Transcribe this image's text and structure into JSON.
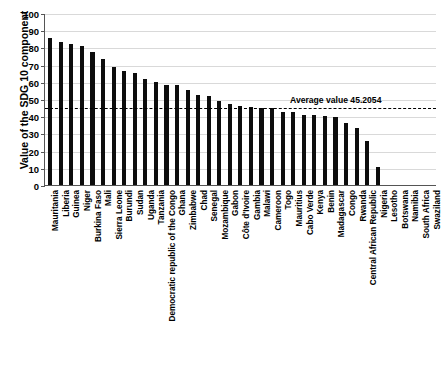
{
  "chart_data": {
    "type": "bar",
    "title": "",
    "xlabel": "",
    "ylabel": "Value of the SDG 10 component",
    "ylim": [
      0,
      100
    ],
    "yticks": [
      0,
      10,
      20,
      30,
      40,
      50,
      60,
      70,
      80,
      90,
      100
    ],
    "grid": true,
    "legend": "none",
    "orientation": "vertical",
    "bar_color": "#0d0d0d",
    "categories": [
      "Mauritania",
      "Liberia",
      "Guinea",
      "Niger",
      "Burkina Faso",
      "Mali",
      "Sierra Leone",
      "Burundi",
      "Sudan",
      "Uganda",
      "Tanzania",
      "Democratic republic of the Congo",
      "Ghana",
      "Zimbabwe",
      "Chad",
      "Senegal",
      "Mozambique",
      "Gabon",
      "Côte d'Ivoire",
      "Gambia",
      "Malawi",
      "Cameroon",
      "Togo",
      "Mauritius",
      "Cabo Verde",
      "Kenya",
      "Benin",
      "Madagascar",
      "Congo",
      "Rwanda",
      "Central African Republic",
      "Nigeria",
      "Lesotho",
      "Botswana",
      "Namibia",
      "South Africa",
      "Swaziland"
    ],
    "values": [
      86.0,
      83.8,
      82.3,
      81.5,
      78.0,
      73.8,
      69.3,
      67.0,
      65.6,
      62.0,
      60.2,
      59.0,
      58.8,
      55.8,
      53.2,
      52.4,
      49.2,
      47.8,
      46.4,
      45.9,
      45.2,
      45.1,
      43.2,
      42.8,
      41.4,
      41.0,
      40.5,
      40.4,
      36.8,
      33.6,
      26.0,
      11.0,
      0.0,
      0.0,
      0.0,
      0.0,
      0.0
    ],
    "annotations": [
      {
        "name": "average-line",
        "label": "Average value 45.2054",
        "value": 45.2054,
        "style": "dashed",
        "color": "#000000"
      }
    ]
  }
}
